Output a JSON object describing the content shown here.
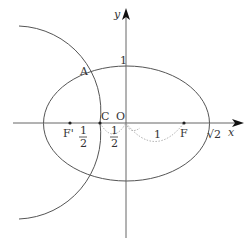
{
  "diagram": {
    "type": "ellipse-and-circle-coordinate-figure",
    "axes": {
      "x_label": "x",
      "y_label": "y",
      "origin_label": "O"
    },
    "points": {
      "A": "A",
      "C": "C",
      "F": "F",
      "F_prime": "F'",
      "O": "O"
    },
    "tick_labels": {
      "y_one": "1",
      "sqrt2": "√2",
      "one_segment": "1",
      "half_left_num": "1",
      "half_left_den": "2",
      "half_right_num": "1",
      "half_right_den": "2"
    },
    "ellipse": {
      "a": "√2",
      "b": "1"
    },
    "colors": {
      "stroke": "#555555",
      "dotted": "#999999",
      "text": "#333333"
    }
  }
}
